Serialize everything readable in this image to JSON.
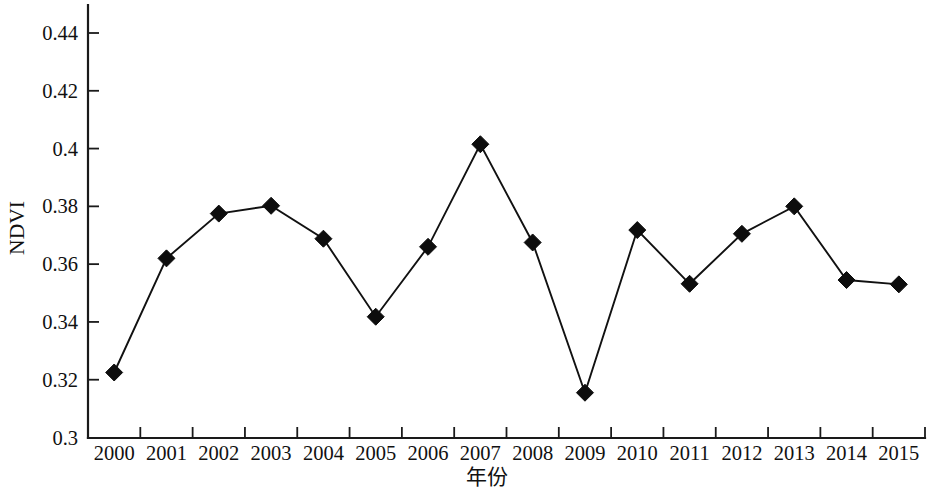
{
  "chart_data": {
    "type": "line",
    "title": "",
    "xlabel": "年份",
    "ylabel": "NDVI",
    "categories": [
      "2000",
      "2001",
      "2002",
      "2003",
      "2004",
      "2005",
      "2006",
      "2007",
      "2008",
      "2009",
      "2010",
      "2011",
      "2012",
      "2013",
      "2014",
      "2015"
    ],
    "x": [
      2000,
      2001,
      2002,
      2003,
      2004,
      2005,
      2006,
      2007,
      2008,
      2009,
      2010,
      2011,
      2012,
      2013,
      2014,
      2015
    ],
    "values": [
      0.3225,
      0.362,
      0.3775,
      0.3802,
      0.3688,
      0.3418,
      0.366,
      0.4015,
      0.3675,
      0.3155,
      0.3718,
      0.3532,
      0.3705,
      0.38,
      0.3545,
      0.353
    ],
    "series": [
      {
        "name": "NDVI",
        "values": [
          0.3225,
          0.362,
          0.3775,
          0.3802,
          0.3688,
          0.3418,
          0.366,
          0.4015,
          0.3675,
          0.3155,
          0.3718,
          0.3532,
          0.3705,
          0.38,
          0.3545,
          0.353
        ],
        "marker": "diamond",
        "marker_color": "#0d0d0d",
        "line_color": "#111111"
      }
    ],
    "ylim": [
      0.3,
      0.45
    ],
    "y_ticks": [
      0.3,
      0.32,
      0.34,
      0.36,
      0.38,
      0.4,
      0.42,
      0.44
    ],
    "y_tick_labels": [
      "0.3",
      "0.32",
      "0.34",
      "0.36",
      "0.38",
      "0.4",
      "0.42",
      "0.44"
    ],
    "x_tick_labels": [
      "2000",
      "2001",
      "2002",
      "2003",
      "2004",
      "2005",
      "2006",
      "2007",
      "2008",
      "2009",
      "2010",
      "2011",
      "2012",
      "2013",
      "2014",
      "2015"
    ],
    "grid": false,
    "legend": false,
    "legend_position": "none",
    "background_color": "#ffffff",
    "axis_color": "#1a1a1a"
  }
}
